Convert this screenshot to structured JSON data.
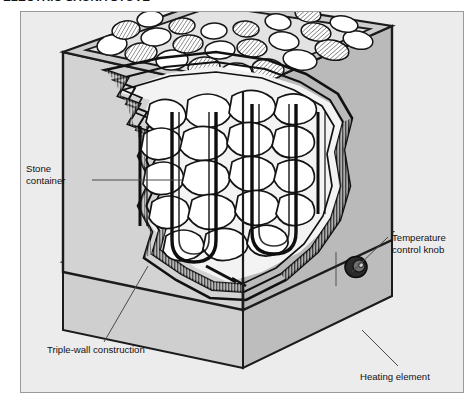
{
  "figure": {
    "title": "ELECTRIC SAUNA STOVE",
    "panel": {
      "background_color": "#ececed",
      "border_color": "#9a9a9c"
    },
    "callouts": [
      {
        "id": "stone-container",
        "label": "Stone\ncontainer",
        "leader": "horizontal-right"
      },
      {
        "id": "triple-wall",
        "label": "Triple-wall construction",
        "leader": "diagonal-up-right"
      },
      {
        "id": "temperature-control-knob",
        "label": "Temperature\ncontrol knob",
        "leader": "diagonal-down-left"
      },
      {
        "id": "heating-element",
        "label": "Heating element",
        "leader": "diagonal-up-left"
      }
    ],
    "colors": {
      "ink": "#111111",
      "body_light": "#d4d4d5",
      "body_mid": "#bcbcbd",
      "body_dark": "#9d9d9e",
      "stone_fill": "#ffffff",
      "knob": "#2a2a2a",
      "leader": "#444444"
    },
    "parts": {
      "stone_tray": "rectangular open top tray filled with sauna stones",
      "stones": "rounded hatched cobbles packed inside the container",
      "heating_elements": "vertical hairpin U-shaped tubular rods among the stones",
      "walls": "three nested torn-edge zigzag layers showing triple-wall construction",
      "knob": "round temperature control knob on the right side panel",
      "base": "plinth beneath the stove body"
    }
  }
}
